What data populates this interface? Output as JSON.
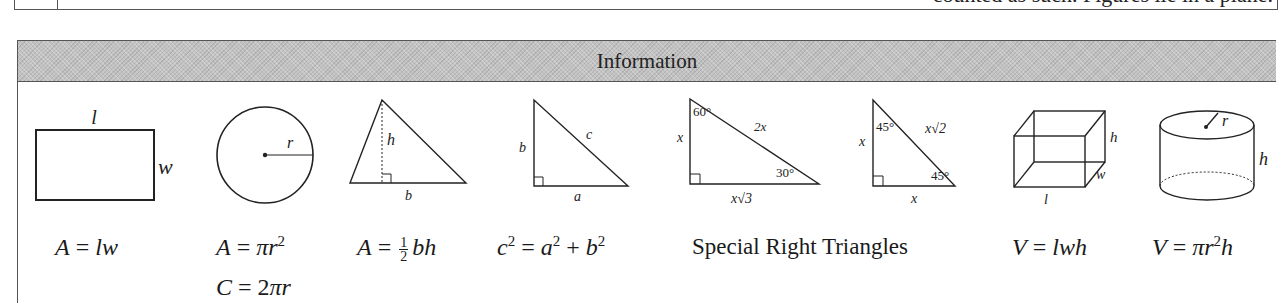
{
  "top_row": {
    "truncated_text": "counted as such. Figures lie in a plane."
  },
  "info_table": {
    "title": "Information",
    "figures": [
      {
        "name": "rectangle",
        "labels": {
          "top": "l",
          "side": "w"
        },
        "formulas": [
          "A = lw"
        ]
      },
      {
        "name": "circle",
        "labels": {
          "radius": "r"
        },
        "formulas": [
          "A = πr²",
          "C = 2πr"
        ]
      },
      {
        "name": "triangle",
        "labels": {
          "height": "h",
          "base": "b"
        },
        "formulas": [
          "A = ½ bh"
        ]
      },
      {
        "name": "right-triangle",
        "labels": {
          "leg_vertical": "b",
          "hypotenuse": "c",
          "leg_horizontal": "a"
        },
        "formulas": [
          "c² = a² + b²"
        ]
      },
      {
        "name": "30-60-90-triangle",
        "labels": {
          "short_leg": "x",
          "angle_top": "60°",
          "hypotenuse": "2x",
          "angle_right": "30°",
          "long_leg": "x√3"
        }
      },
      {
        "name": "45-45-90-triangle",
        "labels": {
          "leg_vertical": "x",
          "angle_top": "45°",
          "hypotenuse": "x√2",
          "angle_right": "45°",
          "leg_horizontal": "x"
        }
      },
      {
        "name": "rectangular-prism",
        "labels": {
          "height": "h",
          "width": "w",
          "length": "l"
        },
        "formulas": [
          "V = lwh"
        ]
      },
      {
        "name": "cylinder",
        "labels": {
          "radius": "r",
          "height": "h"
        },
        "formulas": [
          "V = πr²h"
        ]
      }
    ],
    "special_right_triangles_caption": "Special Right Triangles",
    "formula_parts": {
      "rect": {
        "lhs": "A",
        "eq": " = ",
        "rhs": "lw"
      },
      "circle_area": {
        "lhs": "A",
        "eq": " = ",
        "pi": "π",
        "var": "r",
        "exp": "2"
      },
      "circle_circ": {
        "lhs": "C",
        "eq": " = ",
        "coef": "2",
        "pi": "π",
        "var": "r"
      },
      "triangle": {
        "lhs": "A",
        "eq": " = ",
        "num": "1",
        "den": "2",
        "rhs": "bh"
      },
      "pythag": {
        "c": "c",
        "a": "a",
        "b": "b",
        "exp": "2",
        "eq": " = ",
        "plus": " + "
      },
      "prism": {
        "lhs": "V",
        "eq": " = ",
        "rhs": "lwh"
      },
      "cylinder": {
        "lhs": "V",
        "eq": " = ",
        "pi": "π",
        "var": "r",
        "exp": "2",
        "h": "h"
      }
    }
  }
}
